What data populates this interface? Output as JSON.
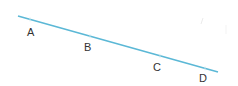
{
  "diagram": {
    "type": "number-line-segment",
    "line": {
      "x1": 18,
      "y1": 16,
      "x2": 218,
      "y2": 72,
      "color": "#5bb8d6"
    },
    "points": [
      {
        "label": "A",
        "line_x": 30,
        "line_y": 19.4,
        "label_x": 27,
        "label_y": 27
      },
      {
        "label": "B",
        "line_x": 90,
        "line_y": 36.2,
        "label_x": 84,
        "label_y": 42
      },
      {
        "label": "C",
        "line_x": 160,
        "line_y": 55.8,
        "label_x": 153,
        "label_y": 62
      },
      {
        "label": "D",
        "line_x": 205,
        "line_y": 68.4,
        "label_x": 199,
        "label_y": 73
      }
    ],
    "label_color": "#333333"
  }
}
